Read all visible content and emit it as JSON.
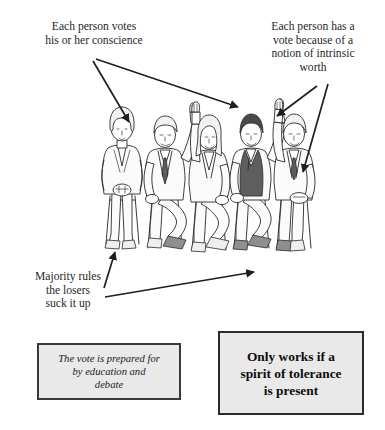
{
  "diagram": {
    "background_color": "#ffffff",
    "ink_color": "#1f1f1f"
  },
  "annotations": [
    {
      "id": "conscience",
      "text": "Each person votes\nhis or her conscience",
      "position": "top-left",
      "arrow_count": 2
    },
    {
      "id": "intrinsic-worth",
      "text": "Each person has a\nvote because of a\nnotion of intrinsic\nworth",
      "position": "top-right",
      "arrow_count": 2
    },
    {
      "id": "majority-rules",
      "text": "Majority rules\nthe losers\nsuck it up",
      "position": "bottom-left",
      "arrow_count": 2
    }
  ],
  "callout_boxes": [
    {
      "id": "vote-prepared",
      "text": "The vote is prepared for\nby education and\ndebate",
      "style": "italic",
      "fill_color": "#e9e9e9",
      "border_color": "#3a3a3a"
    },
    {
      "id": "tolerance",
      "text": "Only works if a\nspirit of tolerance\nis present",
      "style": "bold",
      "fill_color": "#e9e9e9",
      "border_color": "#2b2b2b"
    }
  ],
  "illustration": {
    "description": "Five people seated in a row on stools",
    "people": [
      {
        "id": "person-1",
        "hand_raised": false,
        "note": "woman with bob haircut, hands in lap"
      },
      {
        "id": "person-2",
        "hand_raised": true,
        "note": "man in light suit and dark tie"
      },
      {
        "id": "person-3",
        "hand_raised": true,
        "note": "woman with long hair, light jacket"
      },
      {
        "id": "person-4",
        "hand_raised": true,
        "note": "man with dark hair and dark vest"
      },
      {
        "id": "person-5",
        "hand_raised": true,
        "note": "man in light jacket at right"
      }
    ],
    "raised_hand_count": 4,
    "total_count": 5
  }
}
